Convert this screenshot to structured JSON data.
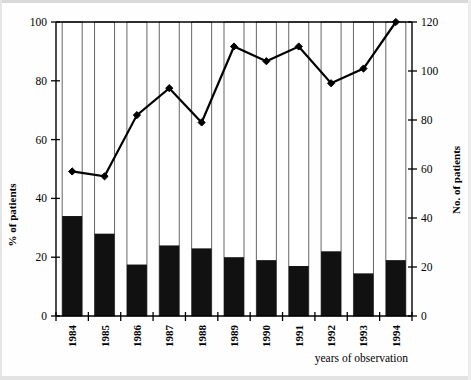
{
  "chart_data": {
    "type": "bar",
    "title": "",
    "subtitle": "",
    "xlabel": "years of observation",
    "ylabel": "% of patients",
    "y2label": "No. of patients",
    "categories": [
      "1984",
      "1985",
      "1986",
      "1987",
      "1988",
      "1989",
      "1990",
      "1991",
      "1992",
      "1993",
      "1994"
    ],
    "series": [
      {
        "name": "% of patients",
        "type": "bar",
        "axis": "left",
        "values": [
          34,
          28,
          17.5,
          24,
          23,
          20,
          19,
          17,
          22,
          14.5,
          19
        ]
      },
      {
        "name": "No. of patients",
        "type": "line",
        "axis": "right",
        "values": [
          59,
          57,
          82,
          93,
          79,
          110,
          104,
          110,
          95,
          101,
          120
        ]
      }
    ],
    "ylim": [
      0,
      100
    ],
    "y2lim": [
      0,
      120
    ],
    "yticks": [
      0,
      20,
      40,
      60,
      80,
      100
    ],
    "y2ticks": [
      0,
      20,
      40,
      60,
      80,
      100,
      120
    ],
    "ytick_labels": [
      "0",
      "20",
      "40",
      "60",
      "80",
      "100"
    ],
    "y2tick_labels": [
      "0",
      "20",
      "40",
      "60",
      "80",
      "100",
      "120"
    ],
    "grid": "vertical-bar-outlines",
    "legend": "none",
    "bar_color": "#111111",
    "bar_outline_color": "#666666",
    "line_color": "#000000",
    "marker": "diamond"
  },
  "axes": {
    "left_title": "% of patients",
    "right_title": "No. of patients",
    "bottom_title": "years of observation"
  }
}
